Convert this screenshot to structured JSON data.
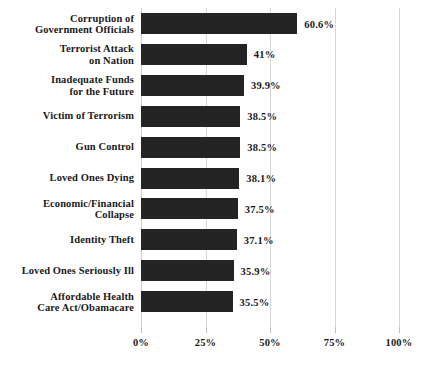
{
  "chart_data": {
    "type": "bar",
    "orientation": "horizontal",
    "title": "",
    "subtitle": "",
    "xlabel": "",
    "ylabel": "",
    "xlim": [
      0,
      100
    ],
    "grid": true,
    "legend": null,
    "xticks": [
      "0%",
      "25%",
      "50%",
      "75%",
      "100%"
    ],
    "xtick_values": [
      0,
      25,
      50,
      75,
      100
    ],
    "bar_color": "#242424",
    "categories": [
      "Corruption of Government Officials",
      "Terrorist Attack on Nation",
      "Inadequate Funds for the Future",
      "Victim of Terrorism",
      "Gun Control",
      "Loved Ones Dying",
      "Economic/Financial Collapse",
      "Identity Theft",
      "Loved Ones Seriously Ill",
      "Affordable Health Care Act/Obamacare"
    ],
    "values": [
      60.6,
      41,
      39.9,
      38.5,
      38.5,
      38.1,
      37.5,
      37.1,
      35.9,
      35.5
    ],
    "value_labels": [
      "60.6%",
      "41%",
      "39.9%",
      "38.5%",
      "38.5%",
      "38.1%",
      "37.5%",
      "37.1%",
      "35.9%",
      "35.5%"
    ],
    "category_lines": [
      [
        "Corruption of",
        "Government Officials"
      ],
      [
        "Terrorist Attack",
        "on Nation"
      ],
      [
        "Inadequate Funds",
        "for the Future"
      ],
      [
        "Victim of Terrorism"
      ],
      [
        "Gun Control"
      ],
      [
        "Loved Ones Dying"
      ],
      [
        "Economic/Financial",
        "Collapse"
      ],
      [
        "Identity Theft"
      ],
      [
        "Loved Ones Seriously Ill"
      ],
      [
        "Affordable Health",
        "Care Act/Obamacare"
      ]
    ]
  }
}
